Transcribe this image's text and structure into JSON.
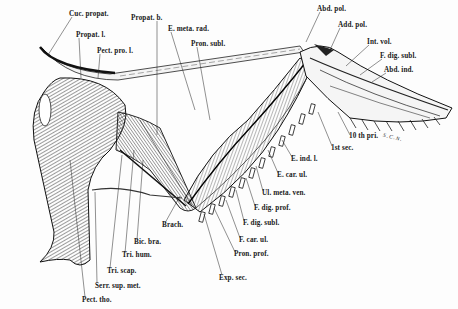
{
  "figure": {
    "signature": "S.C.N.",
    "labels": [
      {
        "id": "cuc-propat",
        "text": "Cuc. propat.",
        "x": 69,
        "y": 11
      },
      {
        "id": "propat-b",
        "text": "Propat. b.",
        "x": 131,
        "y": 15
      },
      {
        "id": "e-meta-rad",
        "text": "E. meta. rad.",
        "x": 168,
        "y": 26
      },
      {
        "id": "propat-l",
        "text": "Propat. l.",
        "x": 76,
        "y": 32
      },
      {
        "id": "pron-subl",
        "text": "Pron. subl.",
        "x": 191,
        "y": 41
      },
      {
        "id": "pect-pro-l",
        "text": "Pect. pro. l.",
        "x": 97,
        "y": 48
      },
      {
        "id": "abd-pol",
        "text": "Abd. pol.",
        "x": 317,
        "y": 6
      },
      {
        "id": "add-pol",
        "text": "Add. pol.",
        "x": 338,
        "y": 22
      },
      {
        "id": "int-vol",
        "text": "Int. vol.",
        "x": 367,
        "y": 39
      },
      {
        "id": "f-dig-subl-top",
        "text": "F. dig. subl.",
        "x": 380,
        "y": 53
      },
      {
        "id": "abd-ind",
        "text": "Abd. ind.",
        "x": 384,
        "y": 67
      },
      {
        "id": "10th-pri",
        "text": "10 th pri.",
        "x": 349,
        "y": 133
      },
      {
        "id": "1st-sec",
        "text": "1st sec.",
        "x": 331,
        "y": 145
      },
      {
        "id": "e-ind-l",
        "text": "E. ind. l.",
        "x": 291,
        "y": 156
      },
      {
        "id": "e-car-ul",
        "text": "E. car. ul.",
        "x": 277,
        "y": 172
      },
      {
        "id": "ul-meta-ven",
        "text": "Ul. meta. ven.",
        "x": 262,
        "y": 190
      },
      {
        "id": "f-dig-prof",
        "text": "F. dig. prof.",
        "x": 254,
        "y": 205
      },
      {
        "id": "f-dig-subl",
        "text": "F. dig. subl.",
        "x": 243,
        "y": 220
      },
      {
        "id": "f-car-ul",
        "text": "F. car. ul.",
        "x": 239,
        "y": 237
      },
      {
        "id": "pron-prof",
        "text": "Pron. prof.",
        "x": 234,
        "y": 251
      },
      {
        "id": "exp-sec",
        "text": "Exp. sec.",
        "x": 219,
        "y": 275
      },
      {
        "id": "brach",
        "text": "Brach.",
        "x": 162,
        "y": 222
      },
      {
        "id": "bic-bra",
        "text": "Bic. bra.",
        "x": 134,
        "y": 239
      },
      {
        "id": "tri-hum",
        "text": "Tri. hum.",
        "x": 122,
        "y": 252
      },
      {
        "id": "tri-scap",
        "text": "Tri. scap.",
        "x": 107,
        "y": 268
      },
      {
        "id": "serr-sup-met",
        "text": "Serr. sup. met.",
        "x": 95,
        "y": 283
      },
      {
        "id": "pect-tho",
        "text": "Pect. tho.",
        "x": 82,
        "y": 297
      }
    ]
  },
  "colors": {
    "ink": "#1a1a1a",
    "paper": "#fdfdfd"
  }
}
